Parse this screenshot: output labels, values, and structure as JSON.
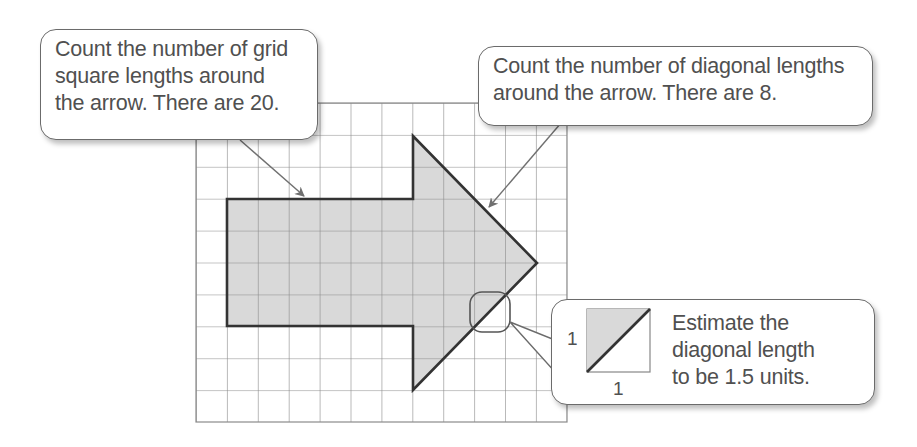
{
  "callouts": {
    "grid_lengths": {
      "lines": [
        "Count the number of grid",
        "square lengths around",
        "the arrow.  There are 20."
      ]
    },
    "diagonal_lengths": {
      "lines": [
        "Count the number of diagonal lengths",
        "around the arrow.  There are 8."
      ]
    },
    "estimate": {
      "lines": [
        "Estimate the",
        "diagonal length",
        "to be 1.5 units."
      ]
    }
  },
  "inset": {
    "side_label": "1",
    "bottom_label": "1"
  },
  "diagram": {
    "grid": {
      "columns": 12,
      "rows": 10
    },
    "shape": "arrow",
    "grid_square_lengths": 20,
    "diagonal_lengths": 8,
    "diagonal_estimate_units": 1.5,
    "colors": {
      "fill": "#d9d9d9",
      "outline": "#333333",
      "grid": "#8a8a8a"
    }
  }
}
